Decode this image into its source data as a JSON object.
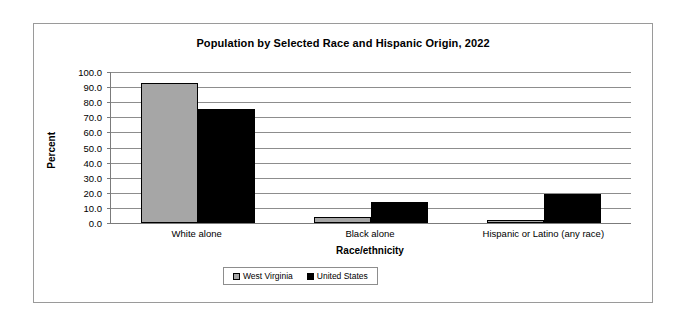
{
  "chart_data": {
    "type": "bar",
    "title": "Population by Selected Race and Hispanic Origin, 2022",
    "xlabel": "Race/ethnicity",
    "ylabel": "Percent",
    "categories": [
      "White alone",
      "Black alone",
      "Hispanic or Latino (any race)"
    ],
    "series": [
      {
        "name": "West Virginia",
        "color": "#A6A6A6",
        "values": [
          92.7,
          3.7,
          2.0
        ]
      },
      {
        "name": "United States",
        "color": "#000000",
        "values": [
          75.5,
          13.6,
          19.1
        ]
      }
    ],
    "ylim": [
      0,
      100
    ],
    "ytick_labels": [
      "100.0",
      "90.0",
      "80.0",
      "70.0",
      "60.0",
      "50.0",
      "40.0",
      "30.0",
      "20.0",
      "10.0",
      "0.0"
    ],
    "ytick_values": [
      100,
      90,
      80,
      70,
      60,
      50,
      40,
      30,
      20,
      10,
      0
    ],
    "grid": true,
    "legend_position": "bottom"
  }
}
